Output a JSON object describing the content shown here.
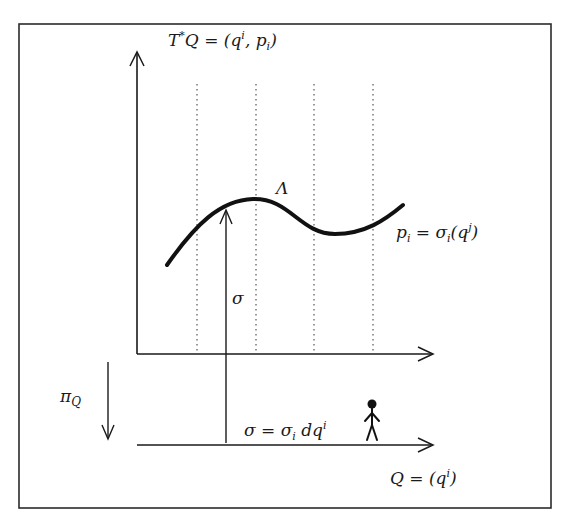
{
  "diagram": {
    "title_label": "T*Q = (qⁱ, pᵢ)",
    "title_parts": {
      "lhs": "T",
      "star": "*",
      "q": "Q = (q",
      "sup": "i",
      "mid": ", p",
      "sub": "i",
      "close": ")"
    },
    "curve_label": "Λ",
    "section_label": "pᵢ = σᵢ(qʲ)",
    "section_parts": {
      "p": "p",
      "pi_sub": "i",
      "eq": " = σ",
      "sigma_sub": "i",
      "open": "(q",
      "sup": "j",
      "close": ")"
    },
    "sigma_label": "σ",
    "projection_label": "π",
    "projection_sub": "Q",
    "one_form_label": "σ = σᵢ dqⁱ",
    "one_form_parts": {
      "a": "σ = σ",
      "sub": "i",
      "b": " dq",
      "sup": "i"
    },
    "base_label": "Q = (qⁱ)",
    "base_parts": {
      "a": "Q = (q",
      "sup": "i",
      "b": ")"
    },
    "colors": {
      "ink": "#1a1a1a",
      "frame": "#2b2b2b",
      "dotted": "#555555",
      "background": "#ffffff"
    },
    "dotted_fibers_x": [
      197,
      256,
      314,
      373
    ],
    "figure": "stick-figure-observer"
  }
}
